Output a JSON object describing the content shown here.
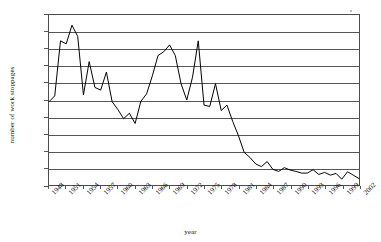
{
  "chart_data": {
    "type": "line",
    "title": "",
    "xlabel": "year",
    "ylabel": "number of work stoppages",
    "ylim": [
      0,
      500
    ],
    "ytick_step": 50,
    "yticks": [
      0,
      50,
      100,
      150,
      200,
      250,
      300,
      350,
      400,
      450,
      500
    ],
    "xlim": [
      1948,
      2002
    ],
    "xticks": [
      1948,
      1951,
      1954,
      1957,
      1960,
      1963,
      1966,
      1969,
      1972,
      1975,
      1978,
      1981,
      1984,
      1987,
      1990,
      1993,
      1996,
      1999,
      2002
    ],
    "xtick_labels": [
      "1948",
      "1951",
      "1954",
      "1957",
      "1960",
      "1963",
      "1966",
      "1969",
      "1972",
      "1975",
      "1978",
      "1981",
      "1984",
      "1987",
      "1990",
      "1993",
      "1996",
      "1999",
      "2002"
    ],
    "grid": "horizontal",
    "legend": "none",
    "series": [
      {
        "name": "work stoppages",
        "color": "#000000",
        "x": [
          1948,
          1949,
          1950,
          1951,
          1952,
          1953,
          1954,
          1955,
          1956,
          1957,
          1958,
          1959,
          1960,
          1961,
          1962,
          1963,
          1964,
          1965,
          1966,
          1967,
          1968,
          1969,
          1970,
          1971,
          1972,
          1973,
          1974,
          1975,
          1976,
          1977,
          1978,
          1979,
          1980,
          1981,
          1982,
          1983,
          1984,
          1985,
          1986,
          1987,
          1988,
          1989,
          1990,
          1991,
          1992,
          1993,
          1994,
          1995,
          1996,
          1997,
          1998,
          1999,
          2000,
          2001,
          2002
        ],
        "values": [
          245,
          262,
          424,
          415,
          470,
          437,
          265,
          363,
          287,
          279,
          332,
          245,
          222,
          195,
          211,
          181,
          246,
          268,
          321,
          381,
          392,
          412,
          381,
          298,
          250,
          317,
          424,
          235,
          231,
          298,
          219,
          235,
          187,
          145,
          96,
          81,
          62,
          54,
          69,
          46,
          40,
          51,
          44,
          40,
          35,
          35,
          45,
          31,
          37,
          29,
          34,
          17,
          39,
          29,
          19
        ]
      }
    ]
  },
  "axes": {
    "y_title": "number of work stoppages",
    "x_title": "year"
  }
}
